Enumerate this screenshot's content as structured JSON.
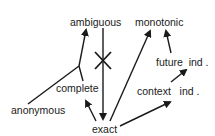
{
  "diagram": {
    "nodes": {
      "ambiguous": {
        "label": "ambiguous"
      },
      "monotonic": {
        "label": "monotonic"
      },
      "future_ind": {
        "label": "future  ind ."
      },
      "context_ind": {
        "label": "context   ind ."
      },
      "complete": {
        "label": "complete"
      },
      "anonymous": {
        "label": "anonymous"
      },
      "exact": {
        "label": "exact"
      }
    },
    "edges": [
      {
        "from": "anonymous",
        "to": "ambiguous",
        "type": "merge-arrow",
        "via": "junction"
      },
      {
        "from": "complete",
        "to": "ambiguous",
        "type": "merge-arrow",
        "via": "junction"
      },
      {
        "from": "ambiguous",
        "to": "exact",
        "type": "arrow",
        "crossed": true
      },
      {
        "from": "exact",
        "to": "complete",
        "type": "arrow"
      },
      {
        "from": "exact",
        "to": "monotonic",
        "type": "arrow"
      },
      {
        "from": "exact",
        "to": "context_ind",
        "type": "arrow"
      },
      {
        "from": "context_ind",
        "to": "future_ind",
        "type": "arrow"
      },
      {
        "from": "future_ind",
        "to": "monotonic",
        "type": "arrow"
      }
    ],
    "colors": {
      "line": "#1a1a1a",
      "background": "#ffffff"
    }
  }
}
